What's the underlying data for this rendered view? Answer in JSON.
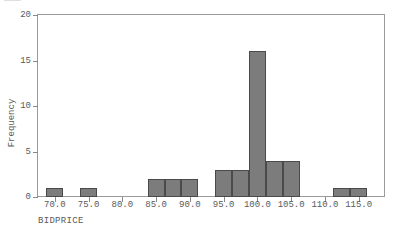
{
  "clipped_header_text": "___",
  "chart_data": {
    "type": "bar",
    "title": "",
    "subtitle": "",
    "xlabel": "BIDPRICE",
    "ylabel": "Frequency",
    "grid": false,
    "legend": null,
    "xlim": [
      67.5,
      118.75
    ],
    "ylim": [
      0,
      20
    ],
    "bin_width": 2.5,
    "x_tick_labels": [
      "70.0",
      "75.0",
      "80.0",
      "85.0",
      "90.0",
      "95.0",
      "100.0",
      "105.0",
      "110.0",
      "115.0"
    ],
    "x_tick_values": [
      70,
      75,
      80,
      85,
      90,
      95,
      100,
      105,
      110,
      115
    ],
    "y_tick_labels": [
      "0",
      "5",
      "10",
      "15",
      "20"
    ],
    "y_tick_values": [
      0,
      5,
      10,
      15,
      20
    ],
    "categories": [
      "68.75-71.25",
      "71.25-73.75",
      "73.75-76.25",
      "76.25-78.75",
      "78.75-81.25",
      "81.25-83.75",
      "83.75-86.25",
      "86.25-88.75",
      "88.75-91.25",
      "91.25-93.75",
      "93.75-96.25",
      "96.25-98.75",
      "98.75-101.25",
      "101.25-103.75",
      "103.75-106.25",
      "106.25-108.75",
      "108.75-111.25",
      "111.25-113.75",
      "113.75-116.25"
    ],
    "bins": [
      {
        "left": 68.75,
        "right": 71.25,
        "value": 1
      },
      {
        "left": 71.25,
        "right": 73.75,
        "value": 0
      },
      {
        "left": 73.75,
        "right": 76.25,
        "value": 1
      },
      {
        "left": 76.25,
        "right": 78.75,
        "value": 0
      },
      {
        "left": 78.75,
        "right": 81.25,
        "value": 0
      },
      {
        "left": 81.25,
        "right": 83.75,
        "value": 0
      },
      {
        "left": 83.75,
        "right": 86.25,
        "value": 2
      },
      {
        "left": 86.25,
        "right": 88.75,
        "value": 2
      },
      {
        "left": 88.75,
        "right": 91.25,
        "value": 2
      },
      {
        "left": 91.25,
        "right": 93.75,
        "value": 0
      },
      {
        "left": 93.75,
        "right": 96.25,
        "value": 3
      },
      {
        "left": 96.25,
        "right": 98.75,
        "value": 3
      },
      {
        "left": 98.75,
        "right": 101.25,
        "value": 16
      },
      {
        "left": 101.25,
        "right": 103.75,
        "value": 4
      },
      {
        "left": 103.75,
        "right": 106.25,
        "value": 4
      },
      {
        "left": 106.25,
        "right": 108.75,
        "value": 0
      },
      {
        "left": 108.75,
        "right": 111.25,
        "value": 0
      },
      {
        "left": 111.25,
        "right": 113.75,
        "value": 1
      },
      {
        "left": 113.75,
        "right": 116.25,
        "value": 1
      }
    ],
    "values": [
      1,
      0,
      1,
      0,
      0,
      0,
      2,
      2,
      2,
      0,
      3,
      3,
      16,
      4,
      4,
      0,
      0,
      1,
      1
    ],
    "colors": {
      "bar_fill": "#7c7c7c",
      "bar_edge": "#4a4a4a",
      "axis": "#9a9a9a",
      "tick_text": "#5a5a5a",
      "background": "#ffffff"
    }
  }
}
